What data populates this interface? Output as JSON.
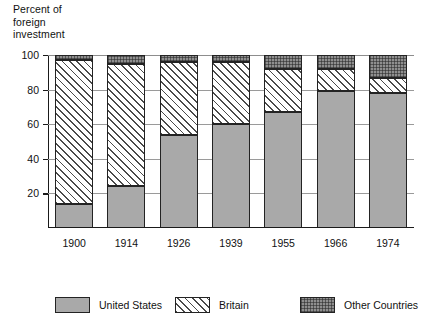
{
  "chart_data": {
    "type": "bar",
    "subtype": "stacked-percentage-column",
    "title": "",
    "ylabel": "Percent of\nforeign\ninvestment",
    "xlabel": "",
    "categories": [
      "1900",
      "1914",
      "1926",
      "1939",
      "1955",
      "1966",
      "1974"
    ],
    "series": [
      {
        "name": "United States",
        "values": [
          14,
          24,
          54,
          60,
          67,
          79,
          78
        ]
      },
      {
        "name": "Britain",
        "values": [
          83,
          71,
          42,
          36,
          25,
          13,
          9
        ]
      },
      {
        "name": "Other Countries",
        "values": [
          3,
          5,
          4,
          4,
          8,
          8,
          13
        ]
      }
    ],
    "ylim": [
      0,
      100
    ],
    "yticks": [
      20,
      40,
      60,
      80,
      100
    ],
    "ytick_labels": [
      "20",
      "40",
      "60",
      "80",
      "100"
    ],
    "grid": true,
    "grid_axis": "y",
    "legend_position": "bottom"
  },
  "legend": {
    "items": [
      {
        "label": "United States",
        "pattern": "solid-gray",
        "color": "#a9a9a9"
      },
      {
        "label": "Britain",
        "pattern": "diagonal-hatch",
        "color": "#ffffff"
      },
      {
        "label": "Other Countries",
        "pattern": "stipple-dots",
        "color": "#8f8f8f"
      }
    ]
  },
  "colors": {
    "united_states": "#a9a9a9",
    "britain": "#ffffff",
    "other_countries": "#8f8f8f",
    "axis": "#1a1a1a",
    "gridline": "#9a9a9a",
    "background": "#ffffff"
  }
}
